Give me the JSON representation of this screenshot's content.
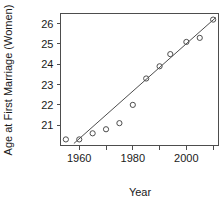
{
  "chart_data": {
    "type": "scatter",
    "title": "",
    "xlabel": "Year",
    "ylabel": "Age at First Marriage (Women)",
    "xlim": [
      1953,
      2012
    ],
    "ylim": [
      20.0,
      26.5
    ],
    "grid": false,
    "legend": null,
    "x": [
      1955,
      1960,
      1965,
      1970,
      1975,
      1980,
      1985,
      1990,
      1994,
      2000,
      2005,
      2010
    ],
    "values": [
      20.3,
      20.3,
      20.6,
      20.8,
      21.1,
      22.0,
      23.3,
      23.9,
      24.5,
      25.1,
      25.3,
      26.2
    ],
    "series": [
      {
        "name": "Age at First Marriage (Women)",
        "marker": "open-circle",
        "values": [
          20.3,
          20.3,
          20.6,
          20.8,
          21.1,
          22.0,
          23.3,
          23.9,
          24.5,
          25.1,
          25.3,
          26.2
        ]
      }
    ],
    "trendline": {
      "name": "fitted-regression-line",
      "x_start": 1958,
      "y_start": 20.1,
      "x_end": 2011,
      "y_end": 26.3
    },
    "xticks": [
      1960,
      1980,
      2000
    ],
    "xtick_labels": [
      "1960",
      "1980",
      "2000"
    ],
    "xticks_minor": [
      1950,
      1970,
      1990,
      2010
    ],
    "yticks": [
      21,
      22,
      23,
      24,
      25,
      26
    ],
    "ytick_labels": [
      "21",
      "22",
      "23",
      "24",
      "25",
      "26"
    ],
    "colors": {
      "axis": "#4d4d4d",
      "marker": "#4d4d4d",
      "line": "#4d4d4d",
      "background": "#ffffff",
      "text": "#1a1a1a"
    }
  }
}
